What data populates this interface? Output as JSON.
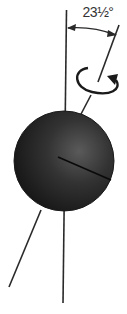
{
  "diagram": {
    "tilt_label": "23½°",
    "elements": [
      {
        "name": "vertical-reference-line",
        "description": "perpendicular to orbital plane"
      },
      {
        "name": "tilted-rotation-axis",
        "description": "Earth's axis tilted 23½° from vertical"
      },
      {
        "name": "tilt-angle-arc",
        "description": "double-headed arc between vertical and axis"
      },
      {
        "name": "rotation-arrow",
        "description": "elliptical arrow around axis indicating rotation direction"
      },
      {
        "name": "earth-sphere",
        "description": "dark shaded globe"
      },
      {
        "name": "equator-line",
        "description": "line across the sphere perpendicular to axis"
      }
    ],
    "colors": {
      "line": "#2a2a2a",
      "sphere_dark": "#1a1a1a",
      "sphere_light": "#5a5a5a",
      "background": "#ffffff"
    }
  }
}
